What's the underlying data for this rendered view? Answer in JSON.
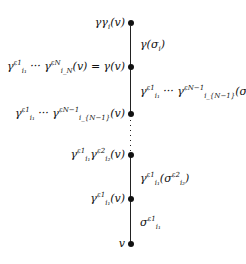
{
  "diagram": {
    "type": "vertical path of vertices with edge labels",
    "vertices": [
      {
        "id": "v0",
        "y": 23,
        "label": "γγ_i(v)"
      },
      {
        "id": "v1",
        "y": 67,
        "label": "γ_{i1}^{ε1} ··· γ_{iN}^{εN}(v) = γ(v)"
      },
      {
        "id": "v2",
        "y": 114,
        "label": "γ_{i1}^{ε1} ··· γ_{iN−1}^{εN−1}(v)"
      },
      {
        "id": "v3",
        "y": 155,
        "label": "γ_{i1}^{ε1} γ_{i2}^{ε2}(v)"
      },
      {
        "id": "v4",
        "y": 199,
        "label": "γ_{i1}^{ε1}(v)"
      },
      {
        "id": "v5",
        "y": 244,
        "label": "v"
      }
    ],
    "edges": [
      {
        "from": "v0",
        "to": "v1",
        "label": "γ(σ_i)"
      },
      {
        "from": "v1",
        "to": "v2",
        "label": "γ_{i1}^{ε1} ··· γ_{iN−1}^{εN−1}(σ_{iN}^{εN})"
      },
      {
        "from": "v2",
        "to": "v3",
        "label": "⋮",
        "style": "dotted"
      },
      {
        "from": "v3",
        "to": "v4",
        "label": "γ_{i1}^{ε1}(σ_{i2}^{ε2})"
      },
      {
        "from": "v4",
        "to": "v5",
        "label": "σ_{i1}^{ε1}"
      }
    ]
  },
  "text": {
    "gamma": "γ",
    "sigma": "σ",
    "v": "v",
    "eps": "ε",
    "dots": "···",
    "eq": "=",
    "i": "i",
    "i1": "i₁",
    "i2": "i₂",
    "iN": "i_N",
    "iN1": "i_{N−1}",
    "e1": "ε1",
    "e2": "ε2",
    "eN": "εN",
    "eN1": "εN−1"
  }
}
